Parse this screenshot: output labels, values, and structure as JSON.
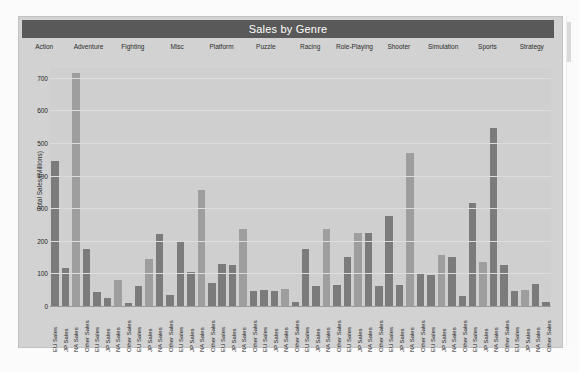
{
  "chart": {
    "title": "Sales by Genre",
    "ylabel": "Total Sales (Millions)",
    "yticks": [
      "0",
      "100",
      "200",
      "300",
      "400",
      "500",
      "600",
      "700"
    ],
    "colors": {
      "title_bar": "#595959",
      "panel": "#d2d2d2",
      "plot": "#cfcfcf",
      "bar_dark": "#7b7b7b",
      "bar_light": "#9e9e9e"
    }
  },
  "chart_data": {
    "type": "bar",
    "title": "Sales by Genre",
    "xlabel": "",
    "ylabel": "Total Sales (Millions)",
    "ylim": [
      0,
      730
    ],
    "grid": true,
    "legend": "none",
    "group_labels": [
      "Action",
      "Adventure",
      "Fighting",
      "Misc",
      "Platform",
      "Puzzle",
      "Racing",
      "Role-Playing",
      "Shooter",
      "Simulation",
      "Sports",
      "Strategy"
    ],
    "measures": [
      "EU Sales",
      "JP Sales",
      "NA Sales",
      "Other Sales"
    ],
    "categories": [
      "EU Sales",
      "JP Sales",
      "NA Sales",
      "Other Sales",
      "EU Sales",
      "JP Sales",
      "NA Sales",
      "Other Sales",
      "EU Sales",
      "JP Sales",
      "NA Sales",
      "Other Sales",
      "EU Sales",
      "JP Sales",
      "NA Sales",
      "Other Sales",
      "EU Sales",
      "JP Sales",
      "NA Sales",
      "Other Sales",
      "EU Sales",
      "JP Sales",
      "NA Sales",
      "Other Sales",
      "EU Sales",
      "JP Sales",
      "NA Sales",
      "Other Sales",
      "EU Sales",
      "JP Sales",
      "NA Sales",
      "Other Sales",
      "EU Sales",
      "JP Sales",
      "NA Sales",
      "Other Sales",
      "EU Sales",
      "JP Sales",
      "NA Sales",
      "Other Sales",
      "EU Sales",
      "JP Sales",
      "NA Sales",
      "Other Sales",
      "EU Sales",
      "JP Sales",
      "NA Sales",
      "Other Sales"
    ],
    "values": [
      445,
      118,
      715,
      175,
      42,
      26,
      80,
      8,
      62,
      145,
      220,
      35,
      195,
      105,
      355,
      70,
      130,
      125,
      235,
      45,
      48,
      45,
      52,
      12,
      175,
      60,
      235,
      65,
      150,
      225,
      225,
      60,
      275,
      65,
      470,
      100,
      95,
      155,
      150,
      32,
      315,
      135,
      545,
      125,
      45,
      49,
      68,
      11
    ],
    "bar_shades": [
      "dark",
      "dark",
      "light",
      "dark",
      "dark",
      "dark",
      "light",
      "dark",
      "dark",
      "light",
      "dark",
      "dark",
      "dark",
      "dark",
      "light",
      "dark",
      "dark",
      "dark",
      "light",
      "dark",
      "dark",
      "dark",
      "light",
      "dark",
      "dark",
      "dark",
      "light",
      "dark",
      "dark",
      "light",
      "dark",
      "dark",
      "dark",
      "dark",
      "light",
      "dark",
      "dark",
      "light",
      "dark",
      "dark",
      "dark",
      "light",
      "dark",
      "dark",
      "dark",
      "light",
      "dark",
      "dark"
    ]
  }
}
